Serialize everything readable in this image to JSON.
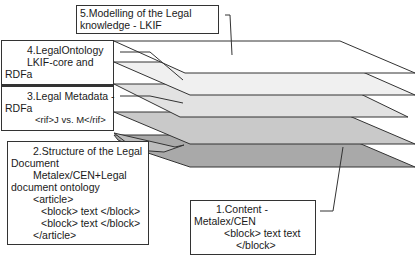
{
  "diagram": {
    "layers": [
      {
        "id": 5,
        "fill": "#ffffff"
      },
      {
        "id": 4,
        "fill": "#f0f0f0"
      },
      {
        "id": 3,
        "fill": "#e2e2e2"
      },
      {
        "id": 2,
        "fill": "#c9c9c9"
      },
      {
        "id": 1,
        "fill": "#a9a9a9"
      }
    ],
    "boxes": {
      "box5": {
        "line1_words": [
          "5.Modelling",
          "of",
          "the",
          "Legal"
        ],
        "line2": "knowledge - LKIF"
      },
      "box4": {
        "line1": "4.LegalOntology",
        "line2_left": "LKIF-core",
        "line2_right": "and",
        "line3": "RDFa"
      },
      "box3": {
        "line1_left": "3.Legal",
        "line1_mid": "Metadata",
        "line1_right": "-",
        "line2": "RDFa",
        "line3": "<rif>J vs. M</rif>"
      },
      "box2": {
        "line1_words": [
          "2.Structure",
          "of",
          "the",
          "Legal"
        ],
        "line2": "Document",
        "line3": "Metalex/CEN+Legal",
        "line4": "document ontology",
        "line5": "<article>",
        "line6": "<block> text </block>",
        "line7": "<block> text </block>",
        "line8": "</article>"
      },
      "box1": {
        "line1_left": "1.Content",
        "line1_right": "-",
        "line2": "Metalex/CEN",
        "line3": "<block> text text",
        "line4": "</block>"
      }
    },
    "colors": {
      "stroke": "#333333",
      "background": "#ffffff"
    }
  }
}
